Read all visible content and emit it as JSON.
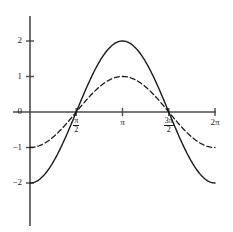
{
  "chart_data": {
    "type": "line",
    "title": "",
    "subtitle": "",
    "xlabel": "",
    "ylabel": "",
    "xlim": [
      0,
      6.283185307179586
    ],
    "ylim": [
      -2.35,
      2.45
    ],
    "grid": false,
    "legend": "none",
    "axis_style": "centered-cross",
    "x_ticks": [
      {
        "value": 1.5707963267948966,
        "label": "pi/2",
        "display": {
          "kind": "fraction",
          "num": "π",
          "den": "2"
        }
      },
      {
        "value": 3.141592653589793,
        "label": "pi",
        "display": {
          "kind": "plain",
          "text": "π"
        }
      },
      {
        "value": 4.71238898038469,
        "label": "3pi/2",
        "display": {
          "kind": "fraction",
          "num": "3π",
          "den": "2"
        }
      },
      {
        "value": 6.283185307179586,
        "label": "2pi",
        "display": {
          "kind": "plain",
          "text": "2π"
        }
      }
    ],
    "y_ticks": [
      {
        "value": 2,
        "label": "2"
      },
      {
        "value": 1,
        "label": "1"
      },
      {
        "value": 0,
        "label": "0"
      },
      {
        "value": -1,
        "label": "−1"
      },
      {
        "value": -2,
        "label": "−2"
      }
    ],
    "series": [
      {
        "name": "solid-curve",
        "expression": "-2*cos(x)",
        "amplitude": 2,
        "style": "solid",
        "color": "#1a1a1a",
        "width": 1.4,
        "x": [
          0,
          0.3141592653589793,
          0.6283185307179586,
          0.9424777960769379,
          1.2566370614359172,
          1.5707963267948966,
          1.8849555921538759,
          2.199114857512855,
          2.5132741228718345,
          2.827433388230814,
          3.141592653589793,
          3.455751918948772,
          3.7699111843077517,
          4.084070449666731,
          4.39822971502571,
          4.71238898038469,
          5.026548245743669,
          5.340707511102648,
          5.654866776461628,
          5.969026041820607,
          6.283185307179586
        ],
        "y": [
          -2,
          -1.902,
          -1.618,
          -1.176,
          -0.618,
          0,
          0.618,
          1.176,
          1.618,
          1.902,
          2,
          1.902,
          1.618,
          1.176,
          0.618,
          0,
          -0.618,
          -1.176,
          -1.618,
          -1.902,
          -2
        ]
      },
      {
        "name": "dashed-curve",
        "expression": "-cos(x)",
        "amplitude": 1,
        "style": "dashed",
        "color": "#1a1a1a",
        "width": 1.3,
        "dash_pattern": "5,3",
        "x": [
          0,
          0.3141592653589793,
          0.6283185307179586,
          0.9424777960769379,
          1.2566370614359172,
          1.5707963267948966,
          1.8849555921538759,
          2.199114857512855,
          2.5132741228718345,
          2.827433388230814,
          3.141592653589793,
          3.455751918948772,
          3.7699111843077517,
          4.084070449666731,
          4.39822971502571,
          4.71238898038469,
          5.026548245743669,
          5.340707511102648,
          5.654866776461628,
          5.969026041820607,
          6.283185307179586
        ],
        "y": [
          -1,
          -0.951,
          -0.809,
          -0.588,
          -0.309,
          0,
          0.309,
          0.588,
          0.809,
          0.951,
          1,
          0.951,
          0.809,
          0.588,
          0.309,
          0,
          -0.309,
          -0.588,
          -0.809,
          -0.951,
          -1
        ]
      }
    ],
    "annotations": [],
    "colors": {
      "axis": "#4a4a4a",
      "curve": "#1a1a1a",
      "background": "#ffffff",
      "text": "#1a1a1a"
    }
  }
}
